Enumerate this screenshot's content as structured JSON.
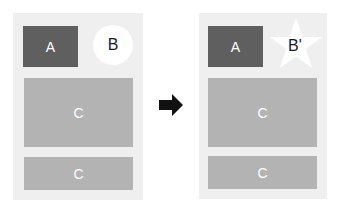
{
  "before": {
    "a_label": "A",
    "b_label": "B",
    "c1_label": "C",
    "c2_label": "C"
  },
  "after": {
    "a_label": "A",
    "b_label": "B'",
    "c1_label": "C",
    "c2_label": "C"
  },
  "colors": {
    "panel": "#efefef",
    "box_a": "#5f5f5f",
    "box_c": "#b3b3b3",
    "arrow": "#111111"
  }
}
